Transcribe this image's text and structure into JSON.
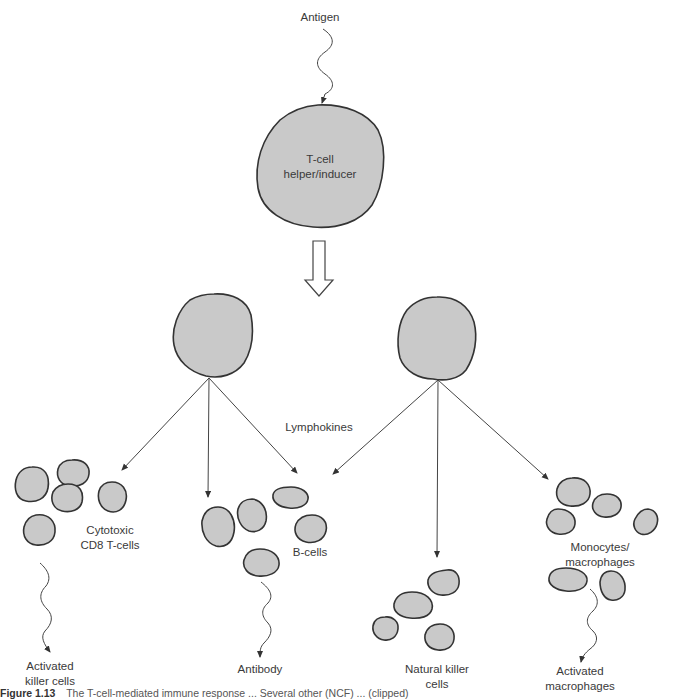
{
  "diagram": {
    "nodes": {
      "antigen": {
        "label": "Antigen"
      },
      "helper": {
        "lines": [
          "T-cell",
          "helper/inducer"
        ]
      },
      "lymphokines": {
        "label": "Lymphokines"
      },
      "cytotoxic": {
        "lines": [
          "Cytotoxic",
          "CD8 T-cells"
        ]
      },
      "bcells": {
        "label": "B-cells"
      },
      "monocytes": {
        "lines": [
          "Monocytes/",
          "macrophages"
        ]
      },
      "activated_killer": {
        "lines": [
          "Activated",
          "killer cells"
        ]
      },
      "antibody": {
        "label": "Antibody"
      },
      "nk": {
        "lines": [
          "Natural killer",
          "cells"
        ]
      },
      "activated_macrophages": {
        "lines": [
          "Activated",
          "macrophages"
        ]
      }
    },
    "edges": [
      {
        "from": "antigen",
        "to": "helper",
        "style": "wavy-arrow"
      },
      {
        "from": "helper",
        "to": "daughter-cells",
        "style": "hollow-arrow"
      },
      {
        "from": "left-daughter-cell",
        "to": "cytotoxic",
        "style": "arrow"
      },
      {
        "from": "left-daughter-cell",
        "to": "bcells",
        "style": "arrow"
      },
      {
        "from": "left-daughter-cell",
        "to": "bcells",
        "style": "arrow"
      },
      {
        "from": "right-daughter-cell",
        "to": "bcells",
        "style": "arrow"
      },
      {
        "from": "right-daughter-cell",
        "to": "nk",
        "style": "arrow"
      },
      {
        "from": "right-daughter-cell",
        "to": "monocytes",
        "style": "arrow"
      },
      {
        "from": "cytotoxic",
        "to": "activated_killer",
        "style": "wavy-arrow"
      },
      {
        "from": "bcells",
        "to": "antibody",
        "style": "wavy-arrow"
      },
      {
        "from": "monocytes",
        "to": "activated_macrophages",
        "style": "wavy-arrow"
      }
    ],
    "colors": {
      "cell_fill": "#c9c9c9",
      "cell_stroke": "#333333",
      "text": "#3a3a3a"
    }
  },
  "caption": {
    "figure": "Figure 1.13",
    "text": "The T-cell-mediated immune response ... Several other (NCF) ... (clipped)"
  }
}
